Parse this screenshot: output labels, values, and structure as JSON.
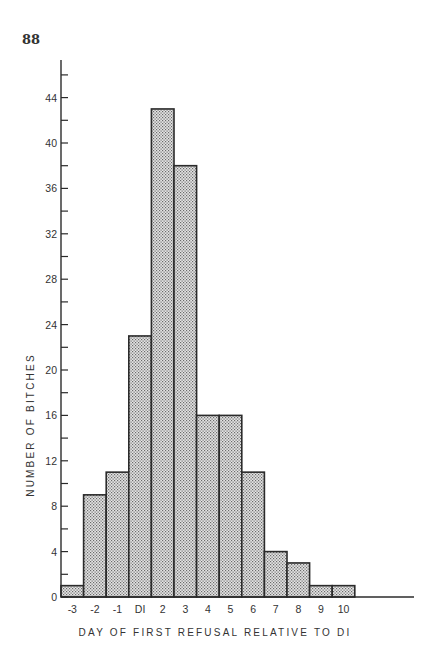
{
  "page": {
    "number": "88"
  },
  "chart_data": {
    "type": "bar",
    "title": "",
    "xlabel": "DAY OF FIRST REFUSAL RELATIVE TO DI",
    "ylabel": "NUMBER OF BITCHES",
    "categories": [
      "-3",
      "-2",
      "-1",
      "DI",
      "2",
      "3",
      "4",
      "5",
      "6",
      "7",
      "8",
      "9",
      "10"
    ],
    "values": [
      1,
      9,
      11,
      23,
      43,
      38,
      16,
      16,
      11,
      4,
      3,
      1,
      1
    ],
    "ylim": [
      0,
      47
    ],
    "yticks": [
      0,
      4,
      8,
      12,
      16,
      20,
      24,
      28,
      32,
      36,
      40,
      44
    ],
    "y_minor_ticks": [
      2,
      6,
      10,
      14,
      18,
      22,
      26,
      30,
      34,
      38,
      42,
      46
    ],
    "grid": false,
    "legend": null,
    "bar_fill": "stippled gray",
    "colors": {
      "bar_fill": "#c9c9c9",
      "bar_edge": "#2b2b2b",
      "axis": "#2b2b2b"
    }
  }
}
